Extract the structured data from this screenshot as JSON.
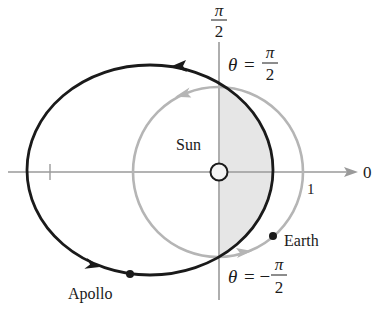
{
  "diagram": {
    "axis_labels": {
      "polar_axis": "0",
      "vertical_top_num": "π",
      "vertical_top_den": "2",
      "unit_tick": "1"
    },
    "annotations": {
      "theta_top": {
        "lhs": "θ",
        "eq": "=",
        "num": "π",
        "den": "2"
      },
      "theta_bottom": {
        "lhs": "θ",
        "eq": "= −",
        "num": "π",
        "den": "2"
      }
    },
    "bodies": {
      "sun": "Sun",
      "earth": "Earth",
      "apollo": "Apollo"
    },
    "orbits": [
      {
        "name": "Apollo orbit",
        "style": "solid",
        "color": "#1a1a1a",
        "direction": "counterclockwise"
      },
      {
        "name": "Earth orbit",
        "style": "solid",
        "color": "#b5b5b5",
        "direction": "counterclockwise",
        "radius_units": 1
      }
    ],
    "shaded_region": {
      "description": "Region between θ = −π/2 and θ = π/2 inside Apollo orbit",
      "color": "#e6e6e6"
    },
    "colors": {
      "axis": "#9a9a9a",
      "apollo_orbit": "#1a1a1a",
      "earth_orbit": "#b5b5b5",
      "shading": "#e6e6e6"
    }
  }
}
